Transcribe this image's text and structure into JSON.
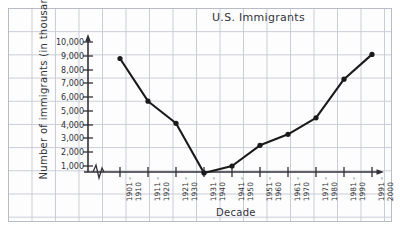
{
  "chart_data": {
    "type": "line",
    "title": "U.S. Immigrants",
    "xlabel": "Decade",
    "ylabel": "Number of immigrants (in thousands)",
    "ylabel_line1": "Number of immigrants",
    "ylabel_line2": "(in thousands)",
    "categories": [
      "1901-1910",
      "1911-1920",
      "1921-1930",
      "1931-1940",
      "1941-1950",
      "1951-1960",
      "1961-1970",
      "1971-1980",
      "1981-1990",
      "1991-2000"
    ],
    "category_lines": [
      [
        "1901 -",
        "1910"
      ],
      [
        "1911 -",
        "1920"
      ],
      [
        "1921 -",
        "1930"
      ],
      [
        "1931 -",
        "1940"
      ],
      [
        "1941 -",
        "1950"
      ],
      [
        "1951 -",
        "1960"
      ],
      [
        "1961 -",
        "1970"
      ],
      [
        "1971 -",
        "1980"
      ],
      [
        "1981 -",
        "1990"
      ],
      [
        "1991 -",
        "2000"
      ]
    ],
    "values": [
      8800,
      5700,
      4100,
      500,
      1000,
      2500,
      3300,
      4500,
      7300,
      9100
    ],
    "ytick_labels": [
      "10,000",
      "9,000",
      "8,000",
      "7,000",
      "6,000",
      "5,000",
      "4,000",
      "3,000",
      "2,000",
      "1,000"
    ],
    "ytick_values": [
      10000,
      9000,
      8000,
      7000,
      6000,
      5000,
      4000,
      3000,
      2000,
      1000
    ],
    "ylim": [
      0,
      10000
    ],
    "grid": true,
    "legend": "none",
    "axis_break": "zigzag",
    "line_color": "#1a1a1a",
    "marker_color": "#1a1a1a",
    "grid_color": "#c9ccd6",
    "paper_color": "#fdfdfd"
  }
}
